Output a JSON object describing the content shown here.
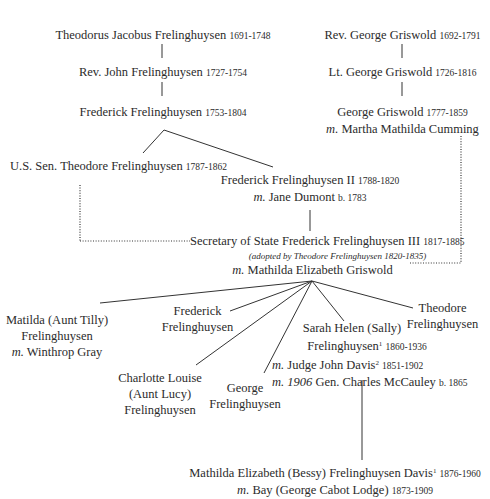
{
  "diagram": {
    "type": "family-tree",
    "left_lineage": [
      {
        "name": "Theodorus Jacobus Frelinghuysen",
        "dates": "1691-1748"
      },
      {
        "name": "Rev. John Frelinghuysen",
        "dates": "1727-1754"
      },
      {
        "name": "Frederick Frelinghuysen",
        "dates": "1753-1804"
      }
    ],
    "right_lineage": [
      {
        "name": "Rev. George Griswold",
        "dates": "1692-1791"
      },
      {
        "name": "Lt. George Griswold",
        "dates": "1726-1816"
      },
      {
        "name": "George Griswold",
        "dates": "1777-1859",
        "m_prefix": "m.",
        "spouse": "Martha Mathilda Cumming"
      }
    ],
    "frederick_children": [
      {
        "name": "U.S. Sen. Theodore Frelinghuysen",
        "dates": "1787-1862"
      },
      {
        "name": "Frederick Frelinghuysen II",
        "dates": "1788-1820",
        "m_prefix": "m.",
        "spouse": "Jane Dumont",
        "spouse_dates": "b. 1783"
      }
    ],
    "central": {
      "name": "Secretary of State Frederick Frelinghuysen III",
      "dates": "1817-1885",
      "note": "(adopted by Theodore Frelinghuysen 1820-1835)",
      "m_prefix": "m.",
      "spouse": "Mathilda Elizabeth Griswold"
    },
    "children": [
      {
        "line1": "Matilda (Aunt Tilly)",
        "line2": "Frelinghuysen",
        "m_prefix": "m.",
        "spouse": "Winthrop Gray"
      },
      {
        "line1": "Frederick",
        "line2": "Frelinghuysen"
      },
      {
        "line1": "Charlotte Louise",
        "line2": "(Aunt Lucy)",
        "line3": "Frelinghuysen"
      },
      {
        "line1": "George",
        "line2": "Frelinghuysen"
      },
      {
        "line1": "Sarah Helen (Sally)",
        "line2": "Frelinghuysen",
        "sup": "1",
        "dates": "1860-1936",
        "m_prefix": "m.",
        "spouse1": "Judge John Davis",
        "spouse1_sup": "2",
        "spouse1_dates": "1851-1902",
        "m2_prefix": "m. 1906",
        "spouse2": "Gen. Charles McCauley",
        "spouse2_dates": "b. 1865"
      },
      {
        "line1": "Theodore",
        "line2": "Frelinghuysen"
      }
    ],
    "grandchild": {
      "name": "Mathilda Elizabeth (Bessy) Frelinghuysen Davis",
      "sup": "1",
      "dates": "1876-1960",
      "m_prefix": "m.",
      "spouse": "Bay (George Cabot Lodge)",
      "spouse_dates": "1873-1909"
    },
    "colors": {
      "text": "#2b2b2b",
      "lines": "#333333",
      "background": "#ffffff"
    }
  }
}
